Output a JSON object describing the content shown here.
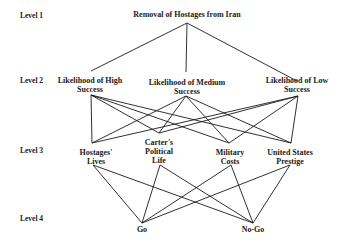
{
  "levels": [
    {
      "label": "Level 1"
    },
    {
      "label": "Level 2"
    },
    {
      "label": "Level 3"
    },
    {
      "label": "Level 4"
    }
  ],
  "goal": {
    "label": "Removal of Hostages from Iran"
  },
  "scenarios": [
    {
      "line1": "Likelihood of High",
      "line2": "Success"
    },
    {
      "line1": "Likelihood of Medium",
      "line2": "Success"
    },
    {
      "line1": "Likelihood of Low",
      "line2": "Success"
    }
  ],
  "criteria": [
    {
      "line1": "Hostages'",
      "line2": "Lives"
    },
    {
      "line1": "Carter's",
      "line2": "Political",
      "line3": "Life"
    },
    {
      "line1": "Military",
      "line2": "Costs"
    },
    {
      "line1": "United States",
      "line2": "Prestige"
    }
  ],
  "alternatives": [
    {
      "label": "Go"
    },
    {
      "label": "No-Go"
    }
  ],
  "edges": {
    "goal_to_scenarios": [
      [
        0,
        0
      ],
      [
        0,
        1
      ],
      [
        0,
        2
      ]
    ],
    "scenarios_to_criteria": [
      [
        0,
        0
      ],
      [
        0,
        1
      ],
      [
        0,
        2
      ],
      [
        0,
        3
      ],
      [
        1,
        0
      ],
      [
        1,
        1
      ],
      [
        1,
        2
      ],
      [
        1,
        3
      ],
      [
        2,
        0
      ],
      [
        2,
        1
      ],
      [
        2,
        2
      ],
      [
        2,
        3
      ]
    ],
    "criteria_to_alternatives": [
      [
        0,
        0
      ],
      [
        0,
        1
      ],
      [
        1,
        0
      ],
      [
        1,
        1
      ],
      [
        2,
        0
      ],
      [
        2,
        1
      ],
      [
        3,
        0
      ],
      [
        3,
        1
      ]
    ]
  }
}
